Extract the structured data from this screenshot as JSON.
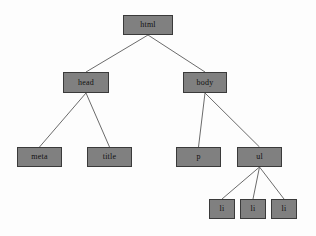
{
  "diagram": {
    "background_color": "#fdfdfd",
    "node_fill_color": "#808080",
    "node_border_color": "#3a3a3a",
    "edge_color": "#6b6b6b",
    "text_color": "#111111",
    "nodes": [
      {
        "id": "html",
        "label": "html",
        "x": 123,
        "y": 15,
        "w": 50,
        "h": 20
      },
      {
        "id": "head",
        "label": "head",
        "x": 63,
        "y": 72,
        "w": 46,
        "h": 21
      },
      {
        "id": "body",
        "label": "body",
        "x": 183,
        "y": 72,
        "w": 44,
        "h": 21
      },
      {
        "id": "meta",
        "label": "meta",
        "x": 17,
        "y": 147,
        "w": 45,
        "h": 20
      },
      {
        "id": "title",
        "label": "title",
        "x": 87,
        "y": 147,
        "w": 45,
        "h": 20
      },
      {
        "id": "p",
        "label": "p",
        "x": 176,
        "y": 147,
        "w": 45,
        "h": 20
      },
      {
        "id": "ul",
        "label": "ul",
        "x": 237,
        "y": 147,
        "w": 45,
        "h": 20
      },
      {
        "id": "li1",
        "label": "li",
        "x": 209,
        "y": 199,
        "w": 26,
        "h": 20
      },
      {
        "id": "li2",
        "label": "li",
        "x": 240,
        "y": 199,
        "w": 26,
        "h": 20
      },
      {
        "id": "li3",
        "label": "li",
        "x": 271,
        "y": 199,
        "w": 26,
        "h": 20
      }
    ],
    "edges": [
      {
        "from": "html",
        "to": "head"
      },
      {
        "from": "html",
        "to": "body"
      },
      {
        "from": "head",
        "to": "meta"
      },
      {
        "from": "head",
        "to": "title"
      },
      {
        "from": "body",
        "to": "p"
      },
      {
        "from": "body",
        "to": "ul"
      },
      {
        "from": "ul",
        "to": "li1"
      },
      {
        "from": "ul",
        "to": "li2"
      },
      {
        "from": "ul",
        "to": "li3"
      }
    ]
  }
}
